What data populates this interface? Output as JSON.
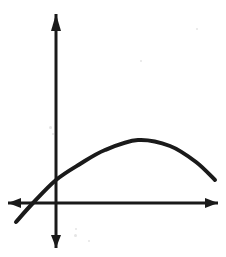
{
  "figure": {
    "kind": "hand-drawn-graph-sketch",
    "width": 226,
    "height": 257,
    "background_color": "#ffffff",
    "ink_color": "#1a1a1a",
    "title": "",
    "caption": ""
  },
  "chart_data": {
    "type": "line",
    "title": "",
    "subtitle": "",
    "xlabel": "",
    "ylabel": "",
    "grid": false,
    "legend": null,
    "legend_position": "none",
    "tick_labels": {
      "x": [],
      "y": []
    },
    "axes": {
      "style": "hand-drawn double-headed arrows",
      "origin_px": {
        "x": 56,
        "y": 203
      },
      "x_axis": {
        "label": "",
        "y_px": 203,
        "start_px": 8,
        "end_px": 218,
        "arrow_left": true,
        "arrow_right": true,
        "stroke_width": 3
      },
      "y_axis": {
        "label": "",
        "x_px": 56,
        "start_px": 14,
        "end_px": 248,
        "arrow_up": true,
        "arrow_down": true,
        "stroke_width": 3
      }
    },
    "series": [
      {
        "name": "parabola",
        "shape": "downward-opening parabola",
        "stroke_width": 4,
        "color": "#1a1a1a",
        "points_px": [
          {
            "x": 16,
            "y": 222
          },
          {
            "x": 33,
            "y": 203
          },
          {
            "x": 56,
            "y": 180
          },
          {
            "x": 80,
            "y": 164
          },
          {
            "x": 105,
            "y": 150
          },
          {
            "x": 138,
            "y": 140
          },
          {
            "x": 170,
            "y": 146
          },
          {
            "x": 196,
            "y": 162
          },
          {
            "x": 215,
            "y": 180
          }
        ],
        "vertex_px": {
          "x": 138,
          "y": 140
        },
        "x_intercept_px": {
          "x": 33,
          "y": 203
        },
        "y_intercept_px": {
          "x": 56,
          "y": 180
        },
        "left_endpoint_px": {
          "x": 16,
          "y": 222
        },
        "right_endpoint_px": {
          "x": 215,
          "y": 180
        }
      }
    ]
  },
  "elements": {
    "x_axis_name": "x-axis",
    "y_axis_name": "y-axis",
    "curve_name": "parabola curve",
    "vertex_name": "vertex",
    "arrow_up_name": "y-axis up arrowhead",
    "arrow_down_name": "y-axis down arrowhead",
    "arrow_left_name": "x-axis left arrowhead",
    "arrow_right_name": "x-axis right arrowhead"
  }
}
